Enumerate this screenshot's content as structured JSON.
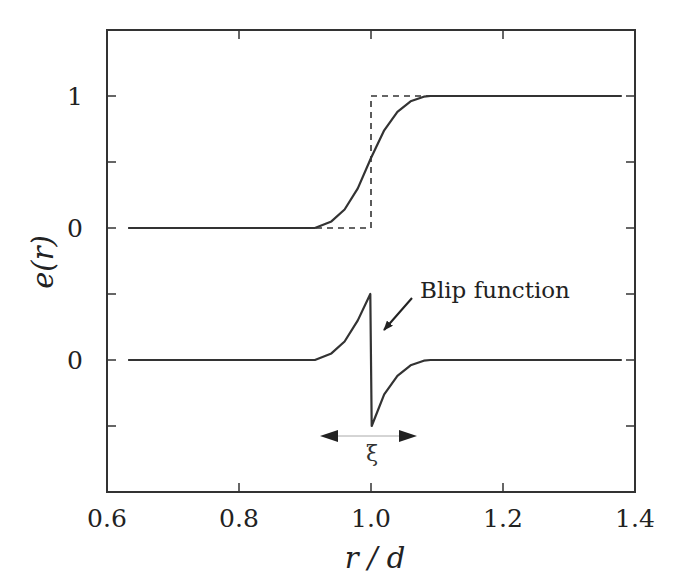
{
  "chart_data": {
    "type": "line",
    "title": "",
    "xlabel": "r / d",
    "ylabel": "e(r)",
    "xlim": [
      0.6,
      1.4
    ],
    "x_ticks": [
      0.6,
      0.8,
      1.0,
      1.2,
      1.4
    ],
    "x_tick_labels": [
      "0.6",
      "0.8",
      "1.0",
      "1.2",
      "1.4"
    ],
    "y_tick_labels": [
      {
        "label": "1",
        "panel": "upper",
        "value": 1
      },
      {
        "label": "0",
        "panel": "upper",
        "value": 0
      },
      {
        "label": "0",
        "panel": "lower",
        "value": 0
      }
    ],
    "y_minor_ticks_note": "unlabeled ticks every 0.5 units",
    "grid": false,
    "legend": null,
    "panels": [
      {
        "name": "upper",
        "baseline_offset": 0,
        "series": [
          {
            "name": "smoothed step",
            "style": "solid",
            "x": [
              0.632,
              0.9,
              0.915,
              0.94,
              0.96,
              0.98,
              1.0,
              1.02,
              1.04,
              1.06,
              1.08,
              1.09,
              1.38
            ],
            "y": [
              0,
              0,
              0.0,
              0.05,
              0.14,
              0.3,
              0.53,
              0.74,
              0.88,
              0.96,
              0.995,
              1.0,
              1.0
            ]
          },
          {
            "name": "sharp step",
            "style": "dashed",
            "x": [
              0.9,
              1.0,
              1.0,
              1.09
            ],
            "y": [
              0,
              0,
              1,
              1
            ]
          }
        ]
      },
      {
        "name": "lower",
        "baseline_offset": 0,
        "series": [
          {
            "name": "blip function",
            "style": "solid",
            "x": [
              0.632,
              0.9,
              0.915,
              0.94,
              0.96,
              0.98,
              0.999,
              1.001,
              1.02,
              1.04,
              1.06,
              1.08,
              1.09,
              1.38
            ],
            "y": [
              0,
              0,
              0.0,
              0.05,
              0.14,
              0.3,
              0.5,
              -0.5,
              -0.26,
              -0.12,
              -0.04,
              -0.005,
              0,
              0
            ]
          }
        ]
      }
    ],
    "annotations": [
      {
        "text": "Blip function",
        "type": "arrow-label",
        "arrow_to": [
          1.02,
          -0.24
        ],
        "text_at": [
          1.08,
          0.26
        ]
      },
      {
        "text": "ξ",
        "type": "double-arrow",
        "x_from": 0.92,
        "x_to": 1.065,
        "label_x": 1.0,
        "description": "width of the smoothing region"
      }
    ]
  },
  "layout": {
    "frame": {
      "x0": 107,
      "x1": 635,
      "y0": 30,
      "y1": 492
    },
    "upper_zero_y": 228,
    "lower_zero_y": 360,
    "unit_px": 132,
    "line_color": "#333333"
  }
}
